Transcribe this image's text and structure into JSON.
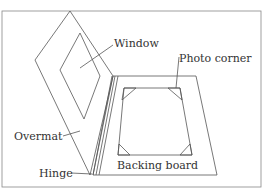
{
  "diagram": {
    "type": "labeled-illustration",
    "labels": {
      "window": "Window",
      "photo_corner": "Photo corner",
      "overmat": "Overmat",
      "hinge": "Hinge",
      "backing_board": "Backing board"
    },
    "colors": {
      "line": "#555555",
      "frame": "#888888",
      "text": "#333333",
      "background": "#ffffff"
    }
  }
}
